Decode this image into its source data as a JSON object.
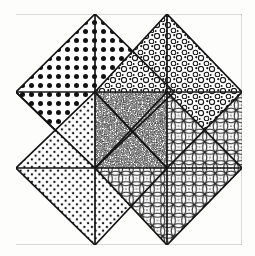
{
  "figure": {
    "background_color": "#fdfdfb",
    "ink_color": "#141414"
  },
  "frame": {
    "label": "outer border",
    "x": 14,
    "y": 13,
    "width": 229,
    "height": 233,
    "stroke_width": 2.2
  },
  "grid": {
    "label": "3x3 construction grid",
    "columns": 3,
    "rows": 3,
    "x0": 16,
    "y0": 14,
    "cell_width": 75.3,
    "cell_height": 76.8,
    "line_width": 1.6,
    "x_lines": [
      16,
      95,
      167,
      242
    ],
    "y_lines": [
      14,
      92,
      168,
      245
    ]
  },
  "textures": {
    "coarse_dots": {
      "name": "coarse-solid-dots",
      "description": "large solid black dots on a regular square lattice",
      "dot_radius": 2.5,
      "spacing": 9,
      "color": "#111111"
    },
    "ring_dots": {
      "name": "open-ring-circles",
      "description": "small hollow rings / open circlets in an offset lattice",
      "ring_radius": 2.6,
      "spacing": 11,
      "color": "#1a1a1a"
    },
    "fine_dots": {
      "name": "fine-stipple-dots",
      "description": "small solid dots on a close regular lattice",
      "dot_radius": 1.2,
      "spacing": 7.5,
      "color": "#161616"
    },
    "noise": {
      "name": "dense-random-speckle",
      "description": "dense irregular random speckle, near-solid mottled grey",
      "density": 0.55,
      "color": "#101010"
    },
    "lattice": {
      "name": "interlocking-circle-lattice",
      "description": "overlapping circles on a square grid forming a woven guilloche lattice",
      "circle_radius": 7.5,
      "spacing": 10.5,
      "color": "#1c1c1c"
    }
  },
  "diamonds": [
    {
      "id": "diamond-top-left",
      "label": "Top-left diamond",
      "center_x": 95,
      "center_y": 92,
      "half_width": 79,
      "half_height": 78,
      "triangles": [
        {
          "position": "north",
          "texture": "coarse_dots"
        },
        {
          "position": "east",
          "texture": "coarse_dots"
        },
        {
          "position": "south",
          "texture": "fine_dots"
        },
        {
          "position": "west",
          "texture": "coarse_dots"
        }
      ]
    },
    {
      "id": "diamond-top-right",
      "label": "Top-right diamond",
      "center_x": 167,
      "center_y": 92,
      "half_width": 75,
      "half_height": 78,
      "triangles": [
        {
          "position": "north",
          "texture": "ring_dots"
        },
        {
          "position": "east",
          "texture": "ring_dots"
        },
        {
          "position": "south",
          "texture": "lattice"
        },
        {
          "position": "west",
          "texture": "ring_dots"
        }
      ]
    },
    {
      "id": "diamond-bottom-left",
      "label": "Bottom-left diamond",
      "center_x": 95,
      "center_y": 168,
      "half_width": 79,
      "half_height": 77,
      "triangles": [
        {
          "position": "north",
          "texture": "fine_dots"
        },
        {
          "position": "east",
          "texture": "fine_dots"
        },
        {
          "position": "south",
          "texture": "blank"
        },
        {
          "position": "west",
          "texture": "fine_dots"
        }
      ]
    },
    {
      "id": "diamond-bottom-right",
      "label": "Bottom-right diamond",
      "center_x": 167,
      "center_y": 168,
      "half_width": 75,
      "half_height": 77,
      "triangles": [
        {
          "position": "north",
          "texture": "lattice"
        },
        {
          "position": "east",
          "texture": "lattice"
        },
        {
          "position": "south",
          "texture": "lattice"
        },
        {
          "position": "west",
          "texture": "lattice"
        }
      ]
    }
  ],
  "center_square": {
    "id": "center-noise-square",
    "label": "Centre stipple square",
    "x": 95,
    "y": 92,
    "width": 72,
    "height": 76,
    "texture": "noise"
  }
}
